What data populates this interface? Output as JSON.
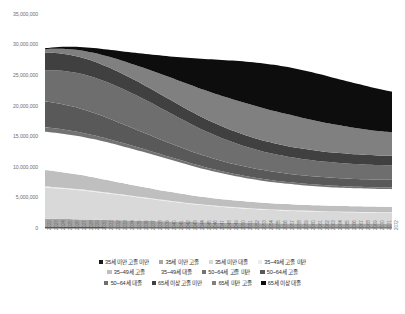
{
  "chart": {
    "type": "area",
    "title": "",
    "subtitle": "",
    "xlabel": "",
    "ylabel": ""
  },
  "yaxis": {
    "min": 0,
    "max": 35000000,
    "step": 5000000,
    "ticks": [
      "0",
      "5,000,000",
      "10,000,000",
      "15,000,000",
      "20,000,000",
      "25,000,000",
      "30,000,000",
      "35,000,000"
    ]
  },
  "legend": {
    "position": "bottom",
    "rows": [
      [
        {
          "label": "35세 미만 고졸 미만",
          "color": "#1a1a1a"
        },
        {
          "label": "35세 미만 고졸",
          "color": "#a6a6a6"
        },
        {
          "label": "35세 미만 대졸",
          "color": "#d9d9d9"
        },
        {
          "label": "35~49세 고졸 미만",
          "color": "#ededed"
        }
      ],
      [
        {
          "label": "35~49세 고졸",
          "color": "#bfbfbf"
        },
        {
          "label": "35~49세 대졸",
          "color": "#ffffff"
        },
        {
          "label": "50~64세 고졸 미만",
          "color": "#737373"
        },
        {
          "label": "50~64세 고졸",
          "color": "#595959"
        }
      ],
      [
        {
          "label": "50~64세 대졸",
          "color": "#6e6e6e"
        },
        {
          "label": "65세 이상 고졸 미만",
          "color": "#404040"
        },
        {
          "label": "65세 미만 고졸",
          "color": "#808080"
        },
        {
          "label": "65세 이상 대졸",
          "color": "#0d0d0d"
        }
      ]
    ]
  },
  "chart_data": {
    "type": "area",
    "stacked": true,
    "title": "",
    "xlabel": "",
    "ylabel": "",
    "ylim": [
      0,
      35000000
    ],
    "grid": false,
    "legend_position": "bottom",
    "x": [
      "2022",
      "2023",
      "2024",
      "2025",
      "2026",
      "2027",
      "2028",
      "2029",
      "2030",
      "2031",
      "2032",
      "2033",
      "2034",
      "2035",
      "2036",
      "2037",
      "2038",
      "2039",
      "2040",
      "2041",
      "2042",
      "2043",
      "2044",
      "2045",
      "2046",
      "2047",
      "2048",
      "2049",
      "2050",
      "2051",
      "2052",
      "2053",
      "2054",
      "2055",
      "2056",
      "2057",
      "2058",
      "2059",
      "2060",
      "2061",
      "2062",
      "2063",
      "2064",
      "2065",
      "2066",
      "2067",
      "2068",
      "2069",
      "2070",
      "2071",
      "2072"
    ],
    "series": [
      {
        "name": "35세 미만 고졸 미만",
        "color": "#1a1a1a",
        "values": [
          120000,
          118000,
          116000,
          114000,
          112000,
          110000,
          108000,
          106000,
          104000,
          102000,
          100000,
          98000,
          96000,
          94000,
          92000,
          90000,
          88000,
          86000,
          84000,
          82000,
          80000,
          78000,
          76000,
          74000,
          72000,
          70000,
          68000,
          66000,
          64000,
          62000,
          60000,
          58000,
          57000,
          56000,
          55000,
          54000,
          53000,
          52000,
          51000,
          50000,
          49000,
          48000,
          47000,
          46000,
          45000,
          44000,
          43000,
          42000,
          41000,
          40000,
          40000
        ]
      },
      {
        "name": "35세 미만 고졸",
        "color": "#a6a6a6",
        "values": [
          1400000,
          1380000,
          1360000,
          1340000,
          1320000,
          1300000,
          1280000,
          1255000,
          1230000,
          1205000,
          1180000,
          1155000,
          1130000,
          1105000,
          1080000,
          1055000,
          1030000,
          1005000,
          980000,
          955000,
          930000,
          905000,
          880000,
          860000,
          840000,
          820000,
          800000,
          785000,
          770000,
          755000,
          740000,
          725000,
          715000,
          705000,
          695000,
          685000,
          675000,
          665000,
          655000,
          645000,
          640000,
          635000,
          630000,
          625000,
          620000,
          615000,
          610000,
          605000,
          600000,
          598000,
          595000
        ]
      },
      {
        "name": "35세 미만 대졸",
        "color": "#d9d9d9",
        "values": [
          5100000,
          5050000,
          4990000,
          4920000,
          4840000,
          4760000,
          4670000,
          4570000,
          4460000,
          4350000,
          4230000,
          4110000,
          3990000,
          3870000,
          3750000,
          3630000,
          3510000,
          3390000,
          3280000,
          3170000,
          3060000,
          2960000,
          2860000,
          2770000,
          2690000,
          2610000,
          2540000,
          2470000,
          2410000,
          2350000,
          2300000,
          2250000,
          2205000,
          2165000,
          2130000,
          2095000,
          2065000,
          2035000,
          2010000,
          1985000,
          1965000,
          1945000,
          1930000,
          1915000,
          1900000,
          1890000,
          1880000,
          1870000,
          1860000,
          1855000,
          1850000
        ]
      },
      {
        "name": "35~49세 고졸 미만",
        "color": "#ededed",
        "values": [
          160000,
          158000,
          156000,
          154000,
          152000,
          150000,
          148000,
          146000,
          144000,
          142000,
          140000,
          138000,
          136000,
          134000,
          132000,
          130000,
          128000,
          126000,
          124000,
          122000,
          120000,
          118000,
          116000,
          114000,
          112000,
          110000,
          108000,
          106000,
          104000,
          102000,
          100000,
          99000,
          98000,
          97000,
          96000,
          95000,
          94000,
          93000,
          92000,
          91000,
          90000,
          89000,
          88000,
          87000,
          86000,
          85000,
          84000,
          83000,
          82000,
          81000,
          80000
        ]
      },
      {
        "name": "35~49세 고졸",
        "color": "#bfbfbf",
        "values": [
          2700000,
          2640000,
          2580000,
          2510000,
          2440000,
          2370000,
          2290000,
          2210000,
          2130000,
          2050000,
          1970000,
          1895000,
          1820000,
          1750000,
          1685000,
          1620000,
          1560000,
          1505000,
          1450000,
          1400000,
          1355000,
          1310000,
          1270000,
          1235000,
          1200000,
          1170000,
          1140000,
          1115000,
          1090000,
          1068000,
          1048000,
          1030000,
          1014000,
          1000000,
          988000,
          977000,
          967000,
          958000,
          950000,
          943000,
          937000,
          932000,
          928000,
          924000,
          921000,
          918000,
          916000,
          914000,
          912000,
          911000,
          910000
        ]
      },
      {
        "name": "35~49세 대졸",
        "color": "#ffffff",
        "values": [
          6250000,
          6280000,
          6300000,
          6310000,
          6310000,
          6300000,
          6280000,
          6250000,
          6210000,
          6160000,
          6100000,
          6030000,
          5950000,
          5860000,
          5760000,
          5650000,
          5530000,
          5400000,
          5270000,
          5130000,
          4990000,
          4845000,
          4700000,
          4560000,
          4420000,
          4290000,
          4160000,
          4040000,
          3925000,
          3815000,
          3715000,
          3620000,
          3535000,
          3455000,
          3385000,
          3320000,
          3260000,
          3205000,
          3155000,
          3110000,
          3070000,
          3035000,
          3005000,
          2978000,
          2955000,
          2935000,
          2918000,
          2903000,
          2890000,
          2880000,
          2872000
        ]
      },
      {
        "name": "50~64세 고졸 미만",
        "color": "#737373",
        "values": [
          760000,
          740000,
          720000,
          700000,
          680000,
          660000,
          640000,
          620000,
          600000,
          580000,
          560000,
          542000,
          524000,
          508000,
          492000,
          476000,
          460000,
          446000,
          432000,
          418000,
          406000,
          394000,
          382000,
          372000,
          362000,
          352000,
          344000,
          336000,
          328000,
          321000,
          314000,
          308000,
          302000,
          297000,
          292000,
          288000,
          284000,
          280000,
          277000,
          274000,
          271000,
          269000,
          267000,
          265000,
          263000,
          262000,
          261000,
          260000,
          259000,
          258000,
          258000
        ]
      },
      {
        "name": "50~64세 고졸",
        "color": "#595959",
        "values": [
          4200000,
          4180000,
          4140000,
          4080000,
          4000000,
          3910000,
          3800000,
          3680000,
          3550000,
          3410000,
          3270000,
          3130000,
          2990000,
          2850000,
          2715000,
          2585000,
          2460000,
          2345000,
          2235000,
          2135000,
          2045000,
          1960000,
          1885000,
          1815000,
          1755000,
          1700000,
          1650000,
          1605000,
          1565000,
          1528000,
          1495000,
          1465000,
          1438000,
          1414000,
          1393000,
          1374000,
          1357000,
          1342000,
          1329000,
          1317000,
          1307000,
          1298000,
          1290000,
          1283000,
          1277000,
          1272000,
          1268000,
          1264000,
          1261000,
          1258000,
          1256000
        ]
      },
      {
        "name": "50~64세 대졸",
        "color": "#6e6e6e",
        "values": [
          5100000,
          5260000,
          5400000,
          5520000,
          5620000,
          5700000,
          5760000,
          5800000,
          5820000,
          5820000,
          5800000,
          5760000,
          5700000,
          5620000,
          5520000,
          5400000,
          5265000,
          5115000,
          4955000,
          4790000,
          4620000,
          4450000,
          4280000,
          4115000,
          3955000,
          3805000,
          3660000,
          3525000,
          3400000,
          3285000,
          3180000,
          3082000,
          2995000,
          2915000,
          2845000,
          2782000,
          2725000,
          2675000,
          2630000,
          2590000,
          2555000,
          2524000,
          2497000,
          2473000,
          2452000,
          2434000,
          2418000,
          2405000,
          2393000,
          2383000,
          2375000
        ]
      },
      {
        "name": "65세 이상 고졸 미만",
        "color": "#404040",
        "values": [
          2900000,
          2860000,
          2820000,
          2780000,
          2740000,
          2700000,
          2660000,
          2620000,
          2580000,
          2540000,
          2500000,
          2460000,
          2420000,
          2380000,
          2340000,
          2300000,
          2262000,
          2224000,
          2186000,
          2150000,
          2115000,
          2080000,
          2046000,
          2014000,
          1983000,
          1953000,
          1924000,
          1896000,
          1870000,
          1845000,
          1821000,
          1798000,
          1777000,
          1757000,
          1738000,
          1720000,
          1703000,
          1687000,
          1672000,
          1658000,
          1645000,
          1633000,
          1622000,
          1612000,
          1603000,
          1595000,
          1588000,
          1582000,
          1577000,
          1573000,
          1570000
        ]
      },
      {
        "name": "65세 미만 고졸",
        "color": "#808080",
        "values": [
          550000,
          640000,
          740000,
          850000,
          970000,
          1100000,
          1240000,
          1390000,
          1550000,
          1720000,
          1900000,
          2090000,
          2290000,
          2500000,
          2720000,
          2950000,
          3180000,
          3410000,
          3640000,
          3860000,
          4070000,
          4270000,
          4455000,
          4625000,
          4780000,
          4915000,
          5030000,
          5125000,
          5200000,
          5255000,
          5290000,
          5305000,
          5300000,
          5280000,
          5245000,
          5195000,
          5130000,
          5055000,
          4970000,
          4875000,
          4775000,
          4670000,
          4565000,
          4460000,
          4355000,
          4255000,
          4160000,
          4070000,
          3985000,
          3910000,
          3840000
        ]
      },
      {
        "name": "65세 이상 대졸",
        "color": "#0d0d0d",
        "values": [
          160000,
          210000,
          275000,
          350000,
          440000,
          545000,
          665000,
          800000,
          955000,
          1125000,
          1315000,
          1520000,
          1745000,
          1985000,
          2245000,
          2520000,
          2810000,
          3115000,
          3430000,
          3755000,
          4085000,
          4420000,
          4755000,
          5085000,
          5410000,
          5725000,
          6025000,
          6310000,
          6575000,
          6820000,
          7040000,
          7235000,
          7400000,
          7540000,
          7650000,
          7730000,
          7785000,
          7810000,
          7810000,
          7785000,
          7740000,
          7675000,
          7595000,
          7500000,
          7395000,
          7280000,
          7160000,
          7035000,
          6910000,
          6785000,
          6660000
        ]
      }
    ]
  }
}
